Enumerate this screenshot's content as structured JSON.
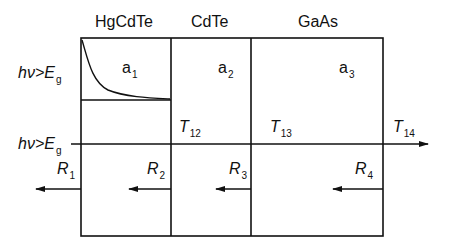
{
  "materials": [
    {
      "label": "HgCdTe"
    },
    {
      "label": "CdTe"
    },
    {
      "label": "GaAs"
    }
  ],
  "row_labels": {
    "top": {
      "prefix": "hν>E",
      "sub": "g"
    },
    "bottom": {
      "prefix": "hν>E",
      "sub": "g"
    }
  },
  "absorption": [
    {
      "base": "a",
      "sub": "1"
    },
    {
      "base": "a",
      "sub": "2"
    },
    {
      "base": "a",
      "sub": "3"
    }
  ],
  "transmission": [
    {
      "base": "T",
      "sub": "12"
    },
    {
      "base": "T",
      "sub": "13"
    },
    {
      "base": "T",
      "sub": "14"
    }
  ],
  "reflection": [
    {
      "base": "R",
      "sub": "1"
    },
    {
      "base": "R",
      "sub": "2"
    },
    {
      "base": "R",
      "sub": "3"
    },
    {
      "base": "R",
      "sub": "4"
    }
  ],
  "colors": {
    "line": "#111111",
    "background": "#ffffff"
  }
}
